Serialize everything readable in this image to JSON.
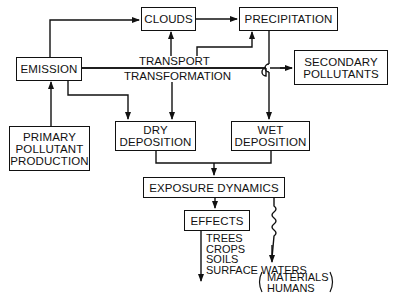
{
  "diagram": {
    "nodes": {
      "clouds": "CLOUDS",
      "precipitation": "PRECIPITATION",
      "emission": "EMISSION",
      "secondary": [
        "SECONDARY",
        "POLLUTANTS"
      ],
      "primary": [
        "PRIMARY",
        "POLLUTANT",
        "PRODUCTION"
      ],
      "dry": [
        "DRY",
        "DEPOSITION"
      ],
      "wet": [
        "WET",
        "DEPOSITION"
      ],
      "exposure": "EXPOSURE DYNAMICS",
      "effects": "EFFECTS"
    },
    "labels": {
      "transport": "TRANSPORT",
      "transformation": "TRANSFORMATION"
    },
    "effects_list": [
      "TREES",
      "CROPS",
      "SOILS",
      "SURFACE WATERS"
    ],
    "other_effects": [
      "MATERIALS",
      "HUMANS"
    ],
    "edges": [
      {
        "from": "EMISSION",
        "to": "CLOUDS"
      },
      {
        "from": "CLOUDS",
        "to": "PRECIPITATION"
      },
      {
        "from": "TRANSPORT/TRANSFORMATION",
        "to": "CLOUDS"
      },
      {
        "from": "TRANSPORT/TRANSFORMATION",
        "to": "PRECIPITATION"
      },
      {
        "from": "EMISSION",
        "to": "SECONDARY POLLUTANTS"
      },
      {
        "from": "PRIMARY POLLUTANT PRODUCTION",
        "to": "EMISSION"
      },
      {
        "from": "EMISSION",
        "to": "DRY DEPOSITION"
      },
      {
        "from": "TRANSPORT/TRANSFORMATION",
        "to": "DRY DEPOSITION"
      },
      {
        "from": "PRECIPITATION",
        "to": "WET DEPOSITION"
      },
      {
        "from": "DRY DEPOSITION",
        "to": "EXPOSURE DYNAMICS"
      },
      {
        "from": "WET DEPOSITION",
        "to": "EXPOSURE DYNAMICS"
      },
      {
        "from": "EXPOSURE DYNAMICS",
        "to": "EFFECTS"
      },
      {
        "from": "EFFECTS",
        "to": "TREES/CROPS/SOILS/SURFACE WATERS"
      },
      {
        "from": "EXPOSURE DYNAMICS",
        "to": "MATERIALS/HUMANS",
        "style": "wavy"
      }
    ]
  }
}
